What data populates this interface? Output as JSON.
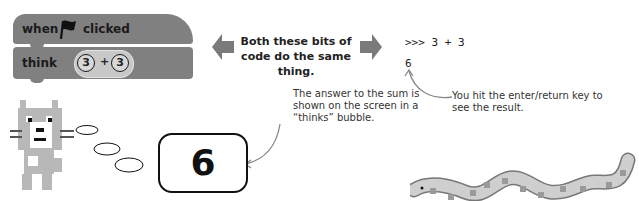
{
  "scratch": {
    "hat_block": {
      "when_label": "when",
      "flag_icon": "green-flag-icon",
      "clicked_label": "clicked"
    },
    "think_block": {
      "label": "think",
      "operand_left": "3",
      "operator": "+",
      "operand_right": "3"
    }
  },
  "middle": {
    "caption": "Both these bits of code do the same thing.",
    "left_arrow_icon": "arrow-left-icon",
    "right_arrow_icon": "arrow-right-icon"
  },
  "python_shell": {
    "prompt_line": ">>> 3 + 3",
    "output_line": "6"
  },
  "annotations": {
    "enter_note": "You hit the enter/return key to see the result.",
    "answer_note": "The answer to the sum is shown on the screen in a “thinks” bubble."
  },
  "thought_bubble": {
    "value": "6"
  },
  "colors": {
    "block_gray": "#808080",
    "operator_gray": "#c8c8c8",
    "arrow_gray": "#7a7a7a"
  }
}
